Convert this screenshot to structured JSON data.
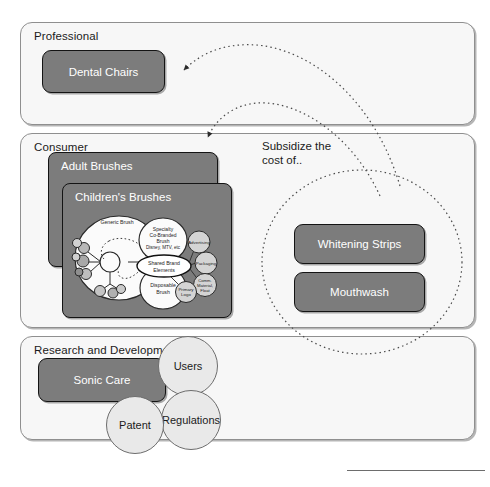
{
  "lanes": [
    {
      "id": "professional",
      "label": "Professional"
    },
    {
      "id": "consumer",
      "label": "Consumer"
    },
    {
      "id": "rnd",
      "label": "Research and Development"
    }
  ],
  "boxes": {
    "dental_chairs": "Dental Chairs",
    "whitening_strips": "Whitening Strips",
    "mouthwash": "Mouthwash",
    "sonic_care": "Sonic Care"
  },
  "panels": {
    "adult_brushes": "Adult Brushes",
    "children_brushes": "Children's Brushes"
  },
  "annotations": {
    "subsidize_line1": "Subsidize the",
    "subsidize_line2": "cost of.."
  },
  "rnd_circles": [
    {
      "id": "users",
      "label": "Users"
    },
    {
      "id": "regulations",
      "label": "Regulations"
    },
    {
      "id": "patent",
      "label": "Patent"
    }
  ],
  "brush_map": {
    "generic_brush": "Generic Brush",
    "specialty_l1": "Specialty",
    "specialty_l2": "Co-Branded",
    "specialty_l3": "Brush",
    "specialty_l4": "Disney, MTV, etc",
    "shared_l1": "Shared Brand",
    "shared_l2": "Elements",
    "disposable_l1": "Disposable",
    "disposable_l2": "Brush",
    "advertising": "Advertising",
    "packaging": "Packaging",
    "comm_l1": "Comm.",
    "comm_l2": "Material,",
    "comm_l3": "Float",
    "primary_l1": "Primary",
    "primary_l2": "Logo"
  },
  "colors": {
    "lane_fill": "#f7f7f7",
    "lane_border": "#8f8f8f",
    "box_fill": "#7c7c7c",
    "box_border": "#141414",
    "box_text": "#ffffff",
    "circle_fill": "#e9e9e9",
    "circle_border": "#6d6d6d",
    "dotted_stroke": "#4a4a4a",
    "page_text": "#1b1b1b"
  }
}
